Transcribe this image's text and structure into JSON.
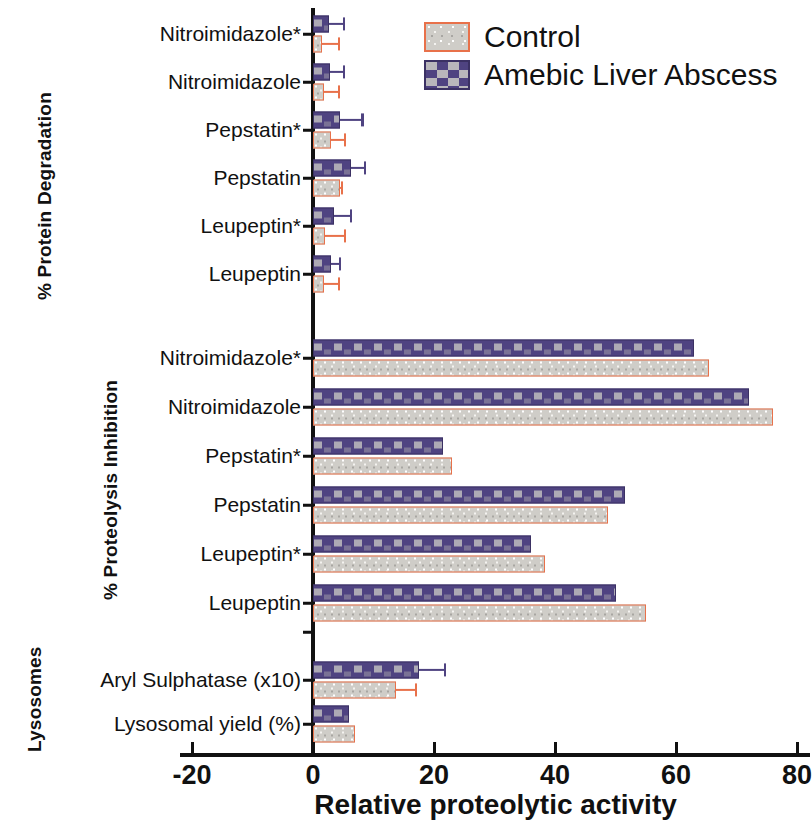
{
  "chart_data": {
    "type": "bar",
    "orientation": "horizontal",
    "title": "",
    "xlabel": "Relative proteolytic activity",
    "ylabel": "",
    "xlim": [
      -20,
      80
    ],
    "xticks": [
      -20,
      0,
      20,
      40,
      60,
      80
    ],
    "xtick_labels": [
      "-20",
      "0",
      "20",
      "40",
      "60",
      "80"
    ],
    "grid": false,
    "legend_position": "top-right",
    "legend": [
      "Control",
      "Amebic Liver Abscess"
    ],
    "series": [
      {
        "name": "Control",
        "color": "#cfcdc8",
        "edge_color": "#e8714a"
      },
      {
        "name": "Amebic Liver Abscess",
        "color": "#4f4381",
        "edge_color": "#3b3163"
      }
    ],
    "groups": [
      {
        "axis_title": "% Protein Degradation",
        "categories": [
          "Nitroimidazole*",
          "Nitroimidazole",
          "Pepstatin*",
          "Pepstatin",
          "Leupeptin*",
          "Leupeptin"
        ],
        "control": [
          1.5,
          1.8,
          3.0,
          4.5,
          2.0,
          1.8
        ],
        "control_err": [
          4.5,
          4.5,
          5.5,
          5.0,
          5.5,
          4.5
        ],
        "ala": [
          2.6,
          2.8,
          4.5,
          6.3,
          3.5,
          3.0
        ],
        "ala_err": [
          5.3,
          5.3,
          8.4,
          8.8,
          6.5,
          4.7
        ]
      },
      {
        "axis_title": "% Proteolysis Inhibition",
        "categories": [
          "Nitroimidazole*",
          "Nitroimidazole",
          "Pepstatin*",
          "Pepstatin",
          "Leupeptin*",
          "Leupeptin"
        ],
        "control": [
          65.5,
          76.0,
          23.0,
          48.7,
          38.3,
          55.0
        ],
        "control_err": [
          null,
          null,
          null,
          null,
          null,
          null
        ],
        "ala": [
          63.0,
          72.0,
          21.5,
          51.5,
          36.0,
          50.0
        ],
        "ala_err": [
          null,
          null,
          null,
          null,
          null,
          null
        ]
      },
      {
        "axis_title": "Lysosomes",
        "categories": [
          "Aryl Sulphatase (x10)",
          "Lysosomal yield (%)"
        ],
        "control": [
          13.7,
          7.0
        ],
        "control_err": [
          17.2,
          null
        ],
        "ala": [
          17.5,
          6.0
        ],
        "ala_err": [
          22.0,
          null
        ]
      }
    ]
  },
  "axis": {
    "x_title": "Relative proteolytic activity",
    "tick_labels": [
      "-20",
      "0",
      "20",
      "40",
      "60",
      "80"
    ]
  },
  "legend": {
    "items": [
      {
        "label": "Control"
      },
      {
        "label": "Amebic Liver Abscess"
      }
    ]
  },
  "group_titles": {
    "degradation": "% Protein Degradation",
    "inhibition": "% Proteolysis Inhibition",
    "lysosomes": "Lysosomes"
  }
}
